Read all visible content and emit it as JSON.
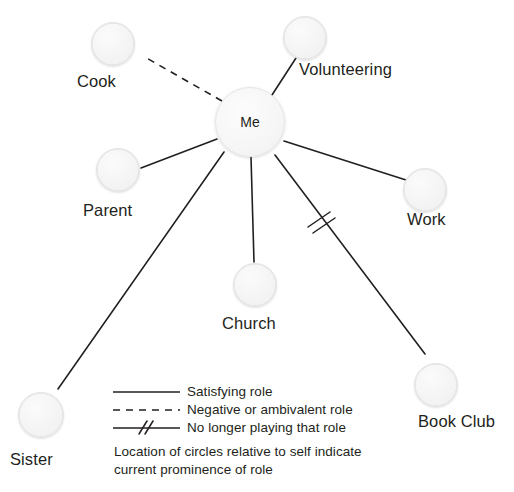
{
  "diagram": {
    "type": "role-map",
    "center": {
      "label": "Me",
      "cx": 250,
      "cy": 122,
      "r": 35
    },
    "nodes": [
      {
        "id": "cook",
        "label": "Cook",
        "cx": 113,
        "cy": 44,
        "r": 22,
        "label_x": 77,
        "label_y": 72,
        "edge": "dashed"
      },
      {
        "id": "volunteering",
        "label": "Volunteering",
        "cx": 305,
        "cy": 38,
        "r": 22,
        "label_x": 299,
        "label_y": 60,
        "edge": "solid"
      },
      {
        "id": "parent",
        "label": "Parent",
        "cx": 118,
        "cy": 170,
        "r": 22,
        "label_x": 83,
        "label_y": 201,
        "edge": "solid"
      },
      {
        "id": "work",
        "label": "Work",
        "cx": 425,
        "cy": 190,
        "r": 22,
        "label_x": 407,
        "label_y": 210,
        "edge": "solid"
      },
      {
        "id": "church",
        "label": "Church",
        "cx": 255,
        "cy": 285,
        "r": 22,
        "label_x": 222,
        "label_y": 314,
        "edge": "solid"
      },
      {
        "id": "book-club",
        "label": "Book Club",
        "cx": 436,
        "cy": 385,
        "r": 22,
        "label_x": 418,
        "label_y": 412,
        "edge": "hashed"
      },
      {
        "id": "sister",
        "label": "Sister",
        "cx": 41,
        "cy": 415,
        "r": 23,
        "label_x": 10,
        "label_y": 450,
        "edge": "solid"
      }
    ],
    "edges": [
      {
        "id": "edge-cook",
        "from": "me",
        "to": "cook",
        "style": "dashed",
        "x1": 222,
        "y1": 101,
        "x2": 143,
        "y2": 56
      },
      {
        "id": "edge-volunteering",
        "from": "me",
        "to": "volunteering",
        "style": "solid",
        "x1": 272,
        "y1": 95,
        "x2": 296,
        "y2": 58
      },
      {
        "id": "edge-parent",
        "from": "me",
        "to": "parent",
        "style": "solid",
        "x1": 217,
        "y1": 139,
        "x2": 141,
        "y2": 168
      },
      {
        "id": "edge-work",
        "from": "me",
        "to": "work",
        "style": "solid",
        "x1": 284,
        "y1": 141,
        "x2": 406,
        "y2": 180
      },
      {
        "id": "edge-church",
        "from": "me",
        "to": "church",
        "style": "solid",
        "x1": 251,
        "y1": 157,
        "x2": 254,
        "y2": 262
      },
      {
        "id": "edge-sister",
        "from": "me",
        "to": "sister",
        "style": "solid",
        "x1": 224,
        "y1": 152,
        "x2": 58,
        "y2": 389
      },
      {
        "id": "edge-book-club",
        "from": "me",
        "to": "book-club",
        "style": "hashed",
        "x1": 275,
        "y1": 155,
        "x2": 425,
        "y2": 354,
        "hash": {
          "cx": 320,
          "cy": 221
        }
      }
    ]
  },
  "legend": {
    "items": [
      {
        "id": "legend-solid",
        "style": "solid",
        "label": "Satisfying role",
        "line_y": 392,
        "text_y": 384
      },
      {
        "id": "legend-dashed",
        "style": "dashed",
        "label": "Negative or ambivalent role",
        "line_y": 410,
        "text_y": 402
      },
      {
        "id": "legend-hashed",
        "style": "hashed",
        "label": "No longer playing that role",
        "line_y": 428,
        "text_y": 420
      }
    ],
    "line_x1": 113,
    "line_x2": 180,
    "text_x": 187,
    "caption": [
      "Location of circles relative to self indicate",
      "current prominence of role"
    ],
    "caption_x": 114,
    "caption_y1": 444,
    "caption_y2": 462
  },
  "colors": {
    "background": "#ffffff",
    "line": "#231f20",
    "text": "#231f20",
    "circle_fill": "#f5f5f6",
    "circle_border": "#e4e4e6"
  }
}
